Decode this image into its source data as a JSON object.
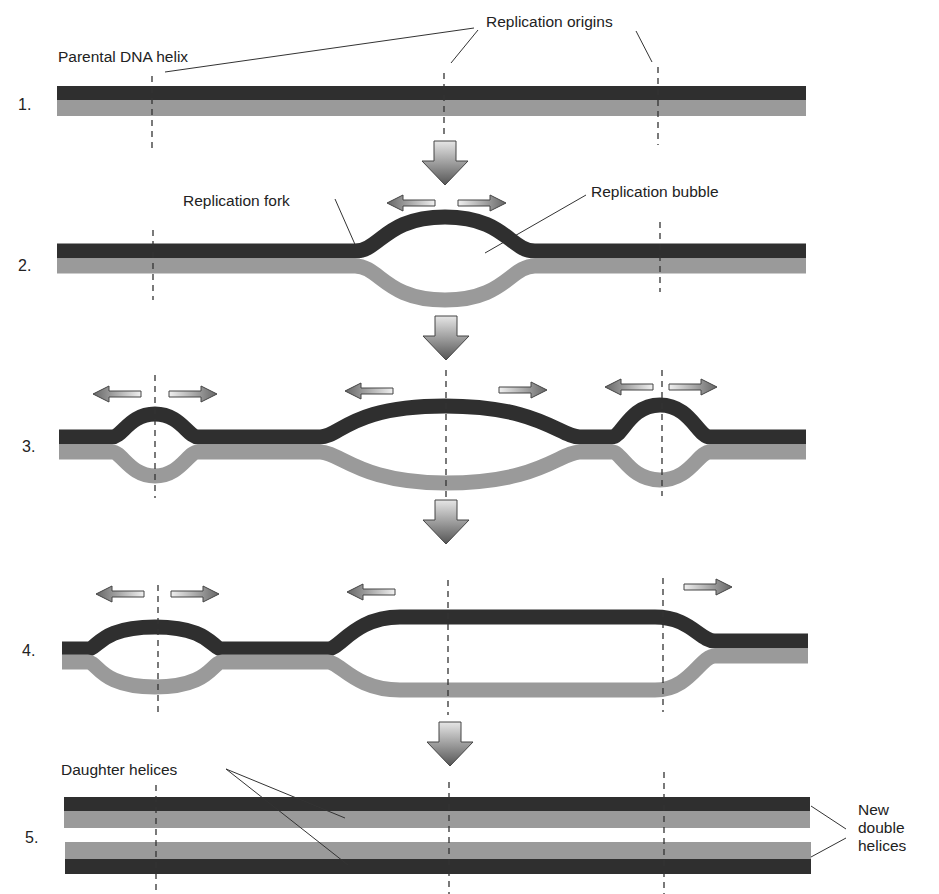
{
  "figure": {
    "labels": {
      "parental_dna_helix": "Parental DNA helix",
      "replication_origins": "Replication origins",
      "replication_fork": "Replication fork",
      "replication_bubble": "Replication bubble",
      "daughter_helices": "Daughter helices",
      "new_double_helices_line1": "New",
      "new_double_helices_line2": "double",
      "new_double_helices_line3": "helices"
    },
    "steps": [
      {
        "number": "1."
      },
      {
        "number": "2."
      },
      {
        "number": "3."
      },
      {
        "number": "4."
      },
      {
        "number": "5."
      }
    ],
    "colors": {
      "parental_strand": "#2f2f2f",
      "new_strand": "#9a9a9a",
      "background": "#ffffff"
    },
    "origins_x": [
      152,
      445,
      657
    ]
  }
}
